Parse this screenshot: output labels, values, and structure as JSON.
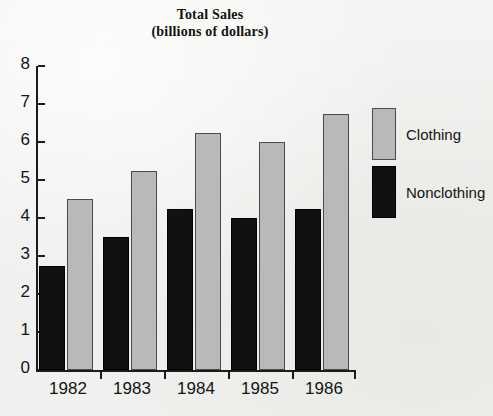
{
  "chart_data": {
    "type": "bar",
    "title": "Total Sales",
    "subtitle": "(billions of dollars)",
    "xlabel": "",
    "ylabel": "",
    "ylim": [
      0,
      8
    ],
    "yticks": [
      "0",
      "1",
      "2",
      "3",
      "4",
      "5",
      "6",
      "7",
      "8"
    ],
    "grid": false,
    "legend_position": "right",
    "categories": [
      "1982",
      "1983",
      "1984",
      "1985",
      "1986"
    ],
    "series": [
      {
        "name": "Nonclothing",
        "color": "#111111",
        "values": [
          2.75,
          3.5,
          4.25,
          4.0,
          4.25
        ]
      },
      {
        "name": "Clothing",
        "color": "#b9b9b9",
        "values": [
          4.5,
          5.25,
          6.25,
          6.0,
          6.75
        ]
      }
    ]
  },
  "legend": {
    "entries": [
      {
        "label": "Clothing",
        "swatch": "clothing"
      },
      {
        "label": "Nonclothing",
        "swatch": "nonclothing"
      }
    ]
  }
}
